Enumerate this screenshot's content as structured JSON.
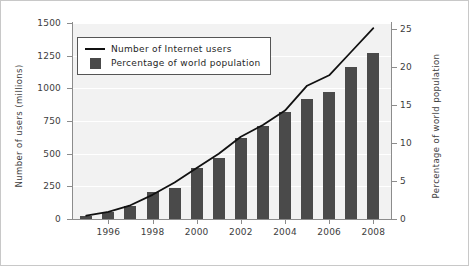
{
  "chart_data": {
    "type": "bar",
    "title": "",
    "subtitle": "",
    "xlabel": "",
    "ylabel": "Number of users (millions)",
    "y2label": "Percentage of world population",
    "grid": true,
    "legend_position": "upper left",
    "x": [
      1995,
      1996,
      1997,
      1998,
      1999,
      2000,
      2001,
      2002,
      2003,
      2004,
      2005,
      2006,
      2007,
      2008
    ],
    "categories": [
      "1995",
      "1996",
      "1997",
      "1998",
      "1999",
      "2000",
      "2001",
      "2002",
      "2003",
      "2004",
      "2005",
      "2006",
      "2007",
      "2008"
    ],
    "xlim": [
      1994.4,
      2008.8
    ],
    "xticks": [
      1996,
      1998,
      2000,
      2002,
      2004,
      2006,
      2008
    ],
    "xticklabels": [
      "1996",
      "1998",
      "2000",
      "2002",
      "2004",
      "2006",
      "2008"
    ],
    "ylim": [
      0,
      1500
    ],
    "yticks": [
      0,
      250,
      500,
      750,
      1000,
      1250,
      1500
    ],
    "yticklabels": [
      "0",
      "250",
      "500",
      "750",
      "1000",
      "1250",
      "1500"
    ],
    "y2lim": [
      0,
      25.8
    ],
    "y2ticks": [
      0,
      5,
      10,
      15,
      20,
      25
    ],
    "y2ticklabels": [
      "0",
      "5",
      "10",
      "15",
      "20",
      "25"
    ],
    "series": [
      {
        "name": "Percentage of world population",
        "type": "bar",
        "axis": "right",
        "color": "#4a4a4a",
        "values": [
          0.4,
          0.9,
          1.7,
          3.6,
          4.1,
          6.7,
          8.0,
          10.7,
          12.3,
          14.1,
          15.8,
          16.7,
          20.0,
          21.9
        ]
      },
      {
        "name": "Number of Internet users",
        "type": "line",
        "axis": "left",
        "color": "#111111",
        "values": [
          25,
          55,
          105,
          185,
          280,
          390,
          500,
          630,
          720,
          830,
          1020,
          1100,
          1280,
          1460
        ]
      }
    ],
    "legend": [
      {
        "label": "Number of Internet users",
        "marker": "line",
        "color": "#111111"
      },
      {
        "label": "Percentage of world population",
        "marker": "square",
        "color": "#4a4a4a"
      }
    ],
    "colors": {
      "bar": "#4a4a4a",
      "line": "#111111",
      "plot_background": "#f2f2f2",
      "gridline": "#ffffff",
      "axis": "#8c8c8c",
      "text": "#3d3d3d",
      "figure_border": "#c8c8c8"
    }
  }
}
